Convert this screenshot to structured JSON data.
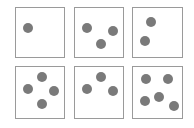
{
  "colors": {
    "dot": "#7a7a7a",
    "border": "#9a9a9a",
    "background": "#ffffff"
  },
  "dot_radius": 5,
  "cards": [
    {
      "label": "1",
      "count": 1,
      "box": [
        15,
        7,
        50,
        51
      ],
      "dots": [
        [
          28,
          28
        ]
      ]
    },
    {
      "label": "3",
      "count": 3,
      "box": [
        74,
        7,
        50,
        51
      ],
      "dots": [
        [
          87,
          28
        ],
        [
          113,
          31
        ],
        [
          101,
          44
        ]
      ]
    },
    {
      "label": "2",
      "count": 2,
      "box": [
        132,
        7,
        51,
        51
      ],
      "dots": [
        [
          151,
          22
        ],
        [
          145,
          41
        ]
      ]
    },
    {
      "label": "4",
      "count": 4,
      "box": [
        15,
        66,
        50,
        53
      ],
      "dots": [
        [
          42,
          77
        ],
        [
          28,
          89
        ],
        [
          54,
          91
        ],
        [
          42,
          104
        ]
      ]
    },
    {
      "label": "3",
      "count": 3,
      "box": [
        74,
        66,
        50,
        53
      ],
      "dots": [
        [
          101,
          77
        ],
        [
          87,
          89
        ],
        [
          113,
          91
        ]
      ]
    },
    {
      "label": "5",
      "count": 5,
      "box": [
        132,
        66,
        51,
        53
      ],
      "dots": [
        [
          146,
          79
        ],
        [
          168,
          79
        ],
        [
          159,
          97
        ],
        [
          145,
          101
        ],
        [
          174,
          106
        ]
      ]
    }
  ]
}
